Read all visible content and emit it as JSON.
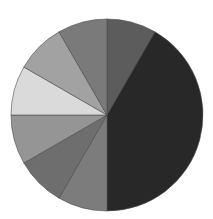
{
  "chart_data": {
    "type": "pie",
    "title": "",
    "legend": [],
    "start_angle_deg": 0,
    "direction": "clockwise",
    "center": [
      107,
      115
    ],
    "radius": 96,
    "slices": [
      {
        "label": "",
        "value": 30,
        "start": 0,
        "end": 30,
        "color": "#5c5c5c"
      },
      {
        "label": "",
        "value": 150,
        "start": 30,
        "end": 180,
        "color": "#282828"
      },
      {
        "label": "",
        "value": 30,
        "start": 180,
        "end": 210,
        "color": "#7c7c7c"
      },
      {
        "label": "",
        "value": 30,
        "start": 210,
        "end": 240,
        "color": "#6e6e6e"
      },
      {
        "label": "",
        "value": 30,
        "start": 240,
        "end": 270,
        "color": "#959595"
      },
      {
        "label": "",
        "value": 30,
        "start": 270,
        "end": 300,
        "color": "#dadada"
      },
      {
        "label": "",
        "value": 30,
        "start": 300,
        "end": 330,
        "color": "#a2a2a2"
      },
      {
        "label": "",
        "value": 30,
        "start": 330,
        "end": 360,
        "color": "#7a7a7a"
      }
    ],
    "values": [
      30,
      150,
      30,
      30,
      30,
      30,
      30,
      30
    ],
    "units": "degrees",
    "stroke_color": "#4a4a4a"
  }
}
